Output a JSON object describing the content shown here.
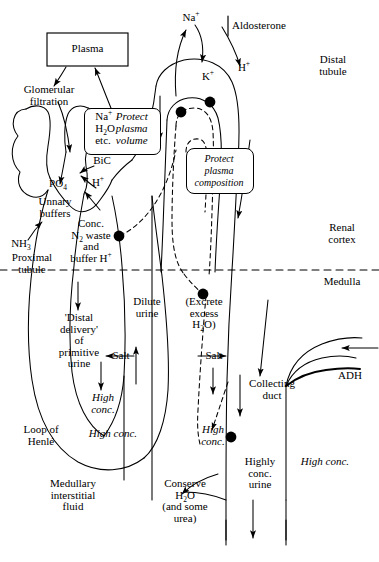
{
  "figure": {
    "type": "anatomical-flow-diagram"
  },
  "boxes": {
    "plasma": {
      "label": "Plasma"
    },
    "protect_volume": {
      "left_lines": "Na⁺\nH₂O\netc.",
      "right_lines": "Protect\nplasma\nvolume",
      "left_items": [
        "Na+",
        "H2O",
        "etc."
      ],
      "right_items": [
        "Protect",
        "plasma",
        "volume"
      ]
    },
    "protect_composition": {
      "label": "Protect\nplasma\ncomposition"
    }
  },
  "labels": {
    "glomerular_filtration": "Glomerular\nfiltration",
    "po4": "PO₄",
    "bic": "BiC",
    "h_plus_left": "H⁺",
    "urinary_buffers": "Unnary\nbuffers",
    "nh3": "NH₃",
    "proximal_tubule": "Proximal\ntubule",
    "conc_n2_waste": "Conc.\nN₂ waste\nand\nbuffer H⁺",
    "distal_delivery": "'Distal\ndelivery'\nof\nprimitive\nurine",
    "salt_left": "Salt",
    "high_conc_inner": "High\nconc.",
    "high_conc_loop": "High conc.",
    "loop_of_henle": "Loop of\nHenlé",
    "medullary_interstitial_fluid": "Medullary\ninterstitial\nfluid",
    "dilute_urine": "Dilute\nurine",
    "excrete_excess_h2o": "(Excrete\nexcess\nH₂O)",
    "salt_right": "Salt",
    "high_conc_right": "High\nconc.",
    "conserve_h2o": "Conserve\nH₂O\n(and some\nurea)",
    "na_plus_top": "Na⁺",
    "aldosterone": "Aldosterone",
    "k_plus": "K⁺",
    "h_plus_distal": "H⁺",
    "distal_tubule": "Distal\ntubule",
    "renal_cortex": "Renal\ncortex",
    "medulla": "Medulla",
    "collecting_duct": "Collecting\nduct",
    "adh": "ADH",
    "highly_conc_urine": "Highly\nconc.\nurine",
    "high_conc_vasa": "High conc."
  },
  "colors": {
    "line": "#000000",
    "background": "#ffffff"
  }
}
